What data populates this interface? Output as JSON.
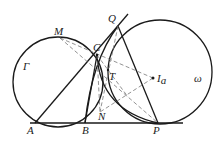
{
  "diagram": {
    "type": "geometry",
    "labels": {
      "M": "M",
      "C": "C",
      "Q": "Q",
      "T": "T",
      "Ia_main": "I",
      "Ia_sub": "a",
      "Gamma": "Γ",
      "omega": "ω",
      "A": "A",
      "B": "B",
      "N": "N",
      "P": "P"
    },
    "circles": [
      {
        "name": "Gamma",
        "cx": 58,
        "cy": 82,
        "r": 45
      },
      {
        "name": "omega",
        "cx": 160,
        "cy": 72,
        "r": 52
      }
    ],
    "points": {
      "A": [
        35,
        123
      ],
      "B": [
        85,
        123
      ],
      "P": [
        158,
        123
      ],
      "C": [
        97,
        55
      ],
      "Q": [
        118,
        26
      ],
      "M": [
        60,
        38
      ],
      "T": [
        108,
        70
      ],
      "Ia": [
        153,
        78
      ],
      "N": [
        100,
        112
      ]
    },
    "colors": {
      "stroke": "#1a1a1a",
      "dashed": "#777777"
    }
  }
}
